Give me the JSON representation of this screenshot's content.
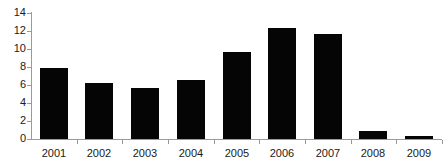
{
  "chart_data": {
    "type": "bar",
    "title": "",
    "subtitle": "",
    "xlabel": "",
    "ylabel": "",
    "categories": [
      "2001",
      "2002",
      "2003",
      "2004",
      "2005",
      "2006",
      "2007",
      "2008",
      "2009"
    ],
    "values": [
      7.9,
      6.25,
      5.7,
      6.55,
      9.7,
      12.35,
      11.65,
      0.85,
      0.35
    ],
    "series": [
      {
        "name": "",
        "values": [
          7.9,
          6.25,
          5.7,
          6.55,
          9.7,
          12.35,
          11.65,
          0.85,
          0.35
        ]
      }
    ],
    "ylim": [
      0,
      14
    ],
    "ytick_labels": [
      "0",
      "2",
      "4",
      "6",
      "8",
      "10",
      "12",
      "14"
    ],
    "ytick_values": [
      0,
      2,
      4,
      6,
      8,
      10,
      12,
      14
    ],
    "grid": false,
    "legend": "none",
    "bar_color": "#050505",
    "axis_color": "#9a9a9a",
    "background_color": "#ffffff",
    "text_color": "#1a1a1a"
  }
}
